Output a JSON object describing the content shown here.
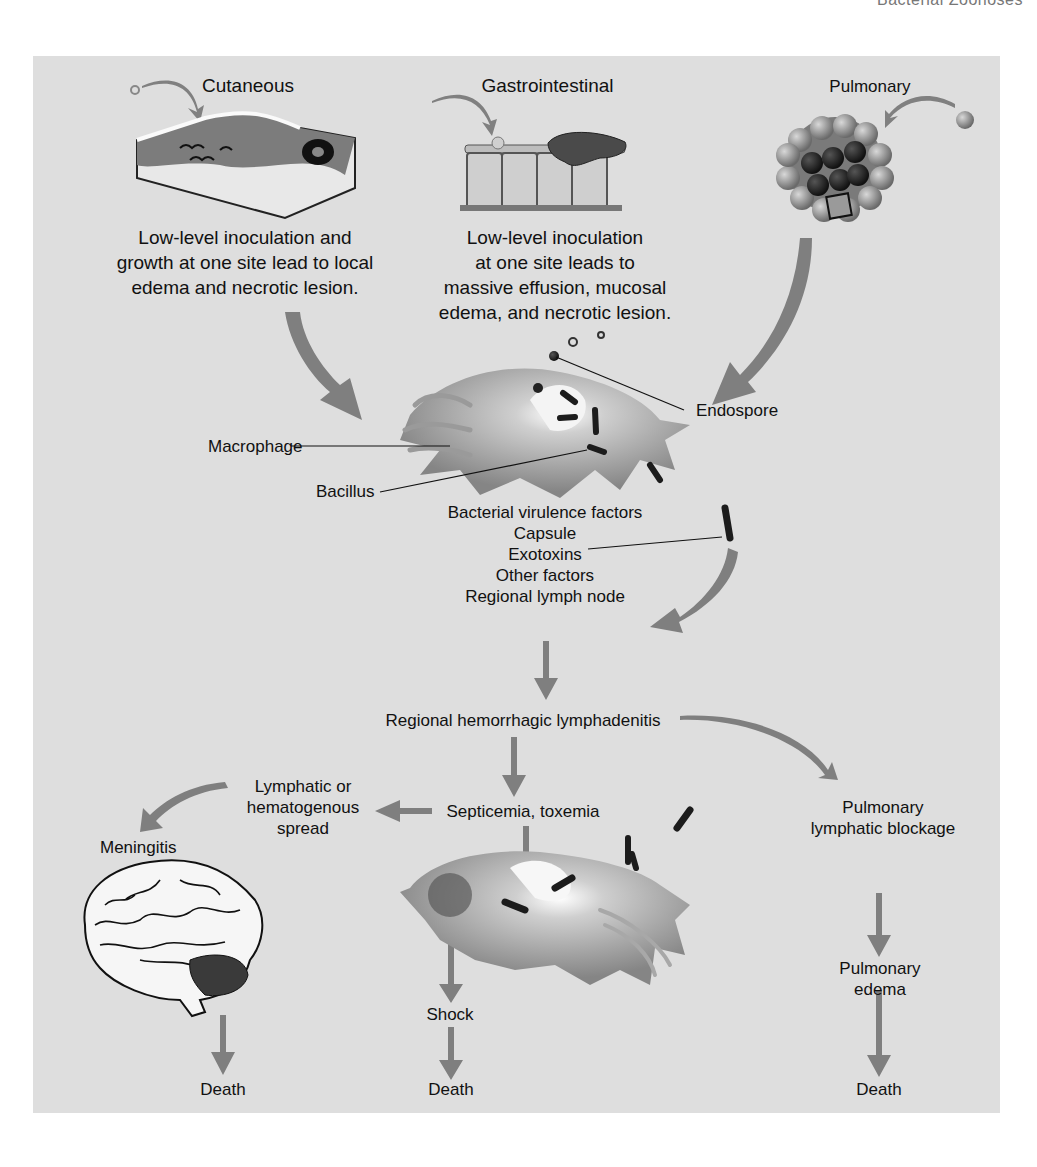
{
  "header": {
    "running_title": "Bacterial Zoonoses"
  },
  "routes": {
    "cutaneous": {
      "title": "Cutaneous",
      "description": [
        "Low-level inoculation and",
        "growth at one site lead to local",
        "edema and necrotic lesion."
      ]
    },
    "gastrointestinal": {
      "title": "Gastrointestinal",
      "description": [
        "Low-level inoculation",
        "at one site leads to",
        "massive effusion, mucosal",
        "edema, and necrotic lesion."
      ]
    },
    "pulmonary": {
      "title": "Pulmonary"
    }
  },
  "cell_labels": {
    "endospore": "Endospore",
    "macrophage": "Macrophage",
    "bacillus": "Bacillus"
  },
  "virulence": {
    "heading": "Bacterial virulence factors",
    "items": [
      "Capsule",
      "Exotoxins",
      "Other factors"
    ],
    "destination": "Regional lymph node"
  },
  "progression": {
    "lymphadenitis": "Regional hemorrhagic lymphadenitis",
    "septicemia": "Septicemia, toxemia",
    "spread": [
      "Lymphatic or",
      "hematogenous",
      "spread"
    ],
    "meningitis": "Meningitis",
    "pulmonary_blockage": [
      "Pulmonary",
      "lymphatic blockage"
    ],
    "pulmonary_edema": [
      "Pulmonary",
      "edema"
    ],
    "shock": "Shock",
    "outcomes": [
      "Death",
      "Death",
      "Death"
    ]
  },
  "colors": {
    "panel_bg": "#dedede",
    "arrow_fill": "#7f7f7f",
    "cell_fill": "#8a8a8a",
    "bacillus": "#1c1c1c"
  }
}
